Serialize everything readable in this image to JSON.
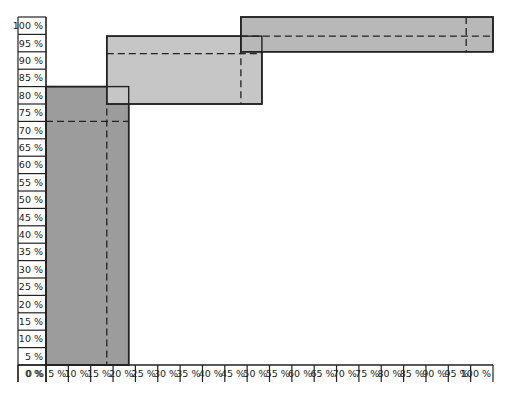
{
  "chart_data": {
    "type": "box-range",
    "title": "",
    "xlabel": "",
    "ylabel": "",
    "xlim": [
      0,
      100
    ],
    "ylim": [
      0,
      100
    ],
    "grid": false,
    "x_ticks": [
      "0 %",
      "5 %",
      "10 %",
      "15 %",
      "20 %",
      "25 %",
      "30 %",
      "35 %",
      "40 %",
      "45 %",
      "50 %",
      "55 %",
      "60 %",
      "65 %",
      "70 %",
      "75 %",
      "80 %",
      "85 %",
      "90 %",
      "95 %",
      "100 %"
    ],
    "y_ticks": [
      "0 %",
      "5 %",
      "10 %",
      "15 %",
      "20 %",
      "25 %",
      "30 %",
      "35 %",
      "40 %",
      "45 %",
      "50 %",
      "55 %",
      "60 %",
      "65 %",
      "70 %",
      "75 %",
      "80 %",
      "85 %",
      "90 %",
      "95 %",
      "100 %"
    ],
    "boxes": [
      {
        "name": "box-1",
        "x0": 0,
        "x1": 18.5,
        "y0": 0,
        "y1": 80,
        "x_mid": 13.6,
        "y_mid": 70,
        "color": "#9c9c9c"
      },
      {
        "name": "box-2",
        "x0": 13.6,
        "x1": 48.3,
        "y0": 75,
        "y1": 94.5,
        "x_mid": 43.6,
        "y_mid": 89.5,
        "color": "#c6c6c6"
      },
      {
        "name": "box-3",
        "x0": 43.6,
        "x1": 100,
        "y0": 90,
        "y1": 100,
        "x_mid": 94,
        "y_mid": 94.5,
        "color": "#b8b8b8"
      }
    ]
  }
}
